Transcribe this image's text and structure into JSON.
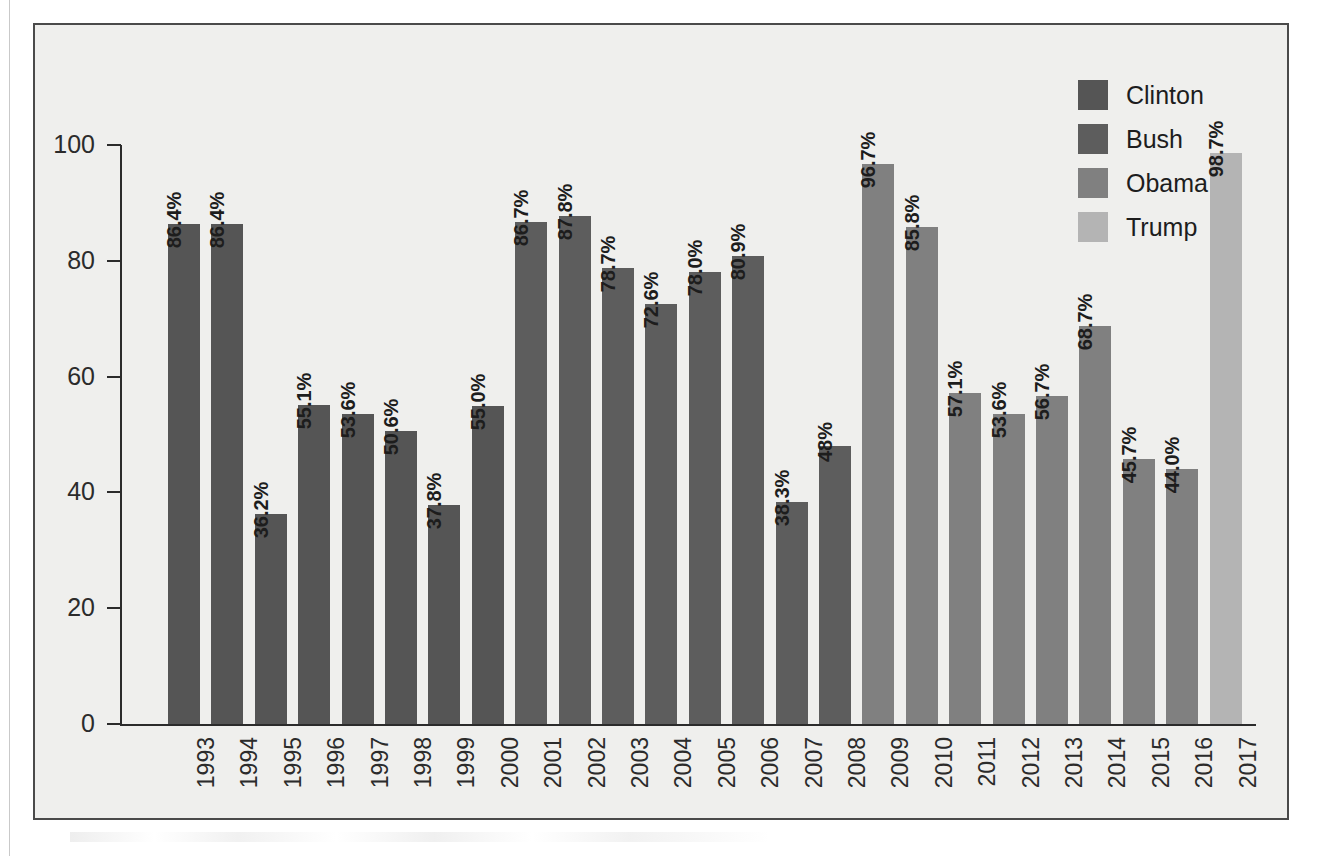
{
  "chart_data": {
    "type": "bar",
    "title": "",
    "xlabel": "",
    "ylabel": "",
    "ylim": [
      0,
      100
    ],
    "ytick_values": [
      100,
      80,
      60,
      40,
      20,
      0
    ],
    "ytick_labels": [
      "100",
      "80",
      "60",
      "40",
      "20",
      "0"
    ],
    "grid": false,
    "legend_position": "top-right",
    "categories": [
      "1993",
      "1994",
      "1995",
      "1996",
      "1997",
      "1998",
      "1999",
      "2000",
      "2001",
      "2002",
      "2003",
      "2004",
      "2005",
      "2006",
      "2007",
      "2008",
      "2009",
      "2010",
      "2011",
      "2012",
      "2013",
      "2014",
      "2015",
      "2016",
      "2017"
    ],
    "values": [
      86.4,
      86.4,
      36.2,
      55.1,
      53.6,
      50.6,
      37.8,
      55.0,
      86.7,
      87.8,
      78.7,
      72.6,
      78.0,
      80.9,
      38.3,
      48.0,
      96.7,
      85.8,
      57.1,
      53.6,
      56.7,
      68.7,
      45.7,
      44.0,
      98.7
    ],
    "data_labels": [
      "86.4%",
      "86.4%",
      "36.2%",
      "55.1%",
      "53.6%",
      "50.6%",
      "37.8%",
      "55.0%",
      "86.7%",
      "87.8%",
      "78.7%",
      "72.6%",
      "78.0%",
      "80.9%",
      "38.3%",
      "48%",
      "96.7%",
      "85.8%",
      "57.1%",
      "53.6%",
      "56.7%",
      "68.7%",
      "45.7%",
      "44.0%",
      "98.7%"
    ],
    "series_group": [
      "Clinton",
      "Clinton",
      "Clinton",
      "Clinton",
      "Clinton",
      "Clinton",
      "Clinton",
      "Clinton",
      "Bush",
      "Bush",
      "Bush",
      "Bush",
      "Bush",
      "Bush",
      "Bush",
      "Bush",
      "Obama",
      "Obama",
      "Obama",
      "Obama",
      "Obama",
      "Obama",
      "Obama",
      "Obama",
      "Trump"
    ],
    "bar_colors": [
      "#555555",
      "#555555",
      "#555555",
      "#555555",
      "#555555",
      "#555555",
      "#555555",
      "#555555",
      "#5d5d5d",
      "#5d5d5d",
      "#5d5d5d",
      "#5d5d5d",
      "#5d5d5d",
      "#5d5d5d",
      "#5d5d5d",
      "#5d5d5d",
      "#808080",
      "#808080",
      "#808080",
      "#808080",
      "#808080",
      "#808080",
      "#808080",
      "#808080",
      "#b4b4b4"
    ]
  },
  "legend": {
    "items": [
      {
        "label": "Clinton",
        "color": "#555555"
      },
      {
        "label": "Bush",
        "color": "#5d5d5d"
      },
      {
        "label": "Obama",
        "color": "#808080"
      },
      {
        "label": "Trump",
        "color": "#b4b4b4"
      }
    ]
  },
  "colors": {
    "frame_border": "#4a4a4a",
    "plot_background": "#efefed",
    "axis": "#2b2b2b",
    "text": "#1d1d1d"
  }
}
